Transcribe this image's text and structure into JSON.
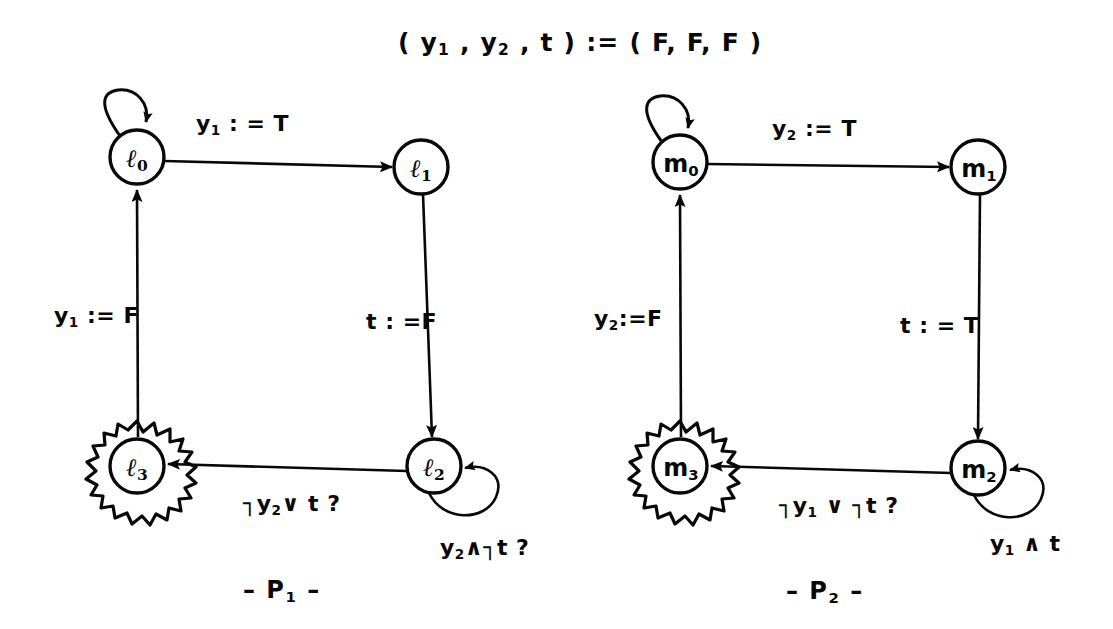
{
  "figure": {
    "title": "( y1 , y2 , t ) := ( F, F, F )",
    "title_parts": {
      "open": "( y",
      "sub1": "1",
      "comma1": " , y",
      "sub2": "2",
      "comma2": " , t ) := ( F, F, F )"
    },
    "background_color": "#ffffff",
    "ink_color": "#080808"
  },
  "processes": [
    {
      "id": "P1",
      "caption": "– P₁ –",
      "caption_base": "– P",
      "caption_sub": "1",
      "caption_tail": " –",
      "nodes": [
        {
          "name": "l0",
          "label_base": "ℓ",
          "label_sub": "0",
          "style": "plain",
          "has_self_loop": true
        },
        {
          "name": "l1",
          "label_base": "ℓ",
          "label_sub": "1",
          "style": "plain",
          "has_self_loop": false
        },
        {
          "name": "l2",
          "label_base": "ℓ",
          "label_sub": "2",
          "style": "plain",
          "has_self_loop": true
        },
        {
          "name": "l3",
          "label_base": "ℓ",
          "label_sub": "3",
          "style": "starburst",
          "has_self_loop": false
        }
      ],
      "edges": [
        {
          "from": "l0",
          "to": "l1",
          "label_base": "y",
          "label_sub": "1",
          "label_tail": " : = T"
        },
        {
          "from": "l1",
          "to": "l2",
          "label_base": "t",
          "label_sub": "",
          "label_tail": " : =F"
        },
        {
          "from": "l2",
          "to": "l3",
          "label_base": "┐y",
          "label_sub": "2",
          "label_tail": "∨ t ?"
        },
        {
          "from": "l3",
          "to": "l0",
          "label_base": "y",
          "label_sub": "1",
          "label_tail": " := F"
        },
        {
          "from": "l2",
          "to": "l2",
          "label_base": "y",
          "label_sub": "2",
          "label_tail": "∧┐t ?"
        },
        {
          "from": "l0",
          "to": "l0",
          "label_base": "",
          "label_sub": "",
          "label_tail": ""
        }
      ]
    },
    {
      "id": "P2",
      "caption": "– P₂ –",
      "caption_base": "– P",
      "caption_sub": "2",
      "caption_tail": " –",
      "nodes": [
        {
          "name": "m0",
          "label_base": "m",
          "label_sub": "0",
          "style": "plain",
          "has_self_loop": true
        },
        {
          "name": "m1",
          "label_base": "m",
          "label_sub": "1",
          "style": "plain",
          "has_self_loop": false
        },
        {
          "name": "m2",
          "label_base": "m",
          "label_sub": "2",
          "style": "plain",
          "has_self_loop": true
        },
        {
          "name": "m3",
          "label_base": "m",
          "label_sub": "3",
          "style": "starburst",
          "has_self_loop": false
        }
      ],
      "edges": [
        {
          "from": "m0",
          "to": "m1",
          "label_base": "y",
          "label_sub": "2",
          "label_tail": " := T"
        },
        {
          "from": "m1",
          "to": "m2",
          "label_base": "t",
          "label_sub": "",
          "label_tail": " : = T"
        },
        {
          "from": "m2",
          "to": "m3",
          "label_base": "┐y",
          "label_sub": "1",
          "label_tail": " ∨ ┐t ?"
        },
        {
          "from": "m3",
          "to": "m0",
          "label_base": "y",
          "label_sub": "2",
          "label_tail": ":=F"
        },
        {
          "from": "m2",
          "to": "m2",
          "label_base": "y",
          "label_sub": "1",
          "label_tail": " ∧ t"
        },
        {
          "from": "m0",
          "to": "m0",
          "label_base": "",
          "label_sub": "",
          "label_tail": ""
        }
      ]
    }
  ],
  "labels": {
    "p1_e01_base": "y",
    "p1_e01_sub": "1",
    "p1_e01_tail": " : = T",
    "p1_e12_base": "t",
    "p1_e12_tail": " : =F",
    "p1_e23_base": "┐y",
    "p1_e23_sub": "2",
    "p1_e23_tail": "∨ t ?",
    "p1_e30_base": "y",
    "p1_e30_sub": "1",
    "p1_e30_tail": " := F",
    "p1_loop2_base": "y",
    "p1_loop2_sub": "2",
    "p1_loop2_tail": "∧┐t ?",
    "p1_caption_base": "– P",
    "p1_caption_sub": "1",
    "p1_caption_tail": " –",
    "p2_e01_base": "y",
    "p2_e01_sub": "2",
    "p2_e01_tail": " := T",
    "p2_e12_base": "t",
    "p2_e12_tail": " : = T",
    "p2_e23_base": "┐y",
    "p2_e23_sub": "1",
    "p2_e23_tail": " ∨ ┐t ?",
    "p2_e30_base": "y",
    "p2_e30_sub": "2",
    "p2_e30_tail": ":=F",
    "p2_loop2_base": "y",
    "p2_loop2_sub": "1",
    "p2_loop2_tail": " ∧ t",
    "p2_caption_base": "– P",
    "p2_caption_sub": "2",
    "p2_caption_tail": " –",
    "n_l0_base": "ℓ",
    "n_l0_sub": "0",
    "n_l1_base": "ℓ",
    "n_l1_sub": "1",
    "n_l2_base": "ℓ",
    "n_l2_sub": "2",
    "n_l3_base": "ℓ",
    "n_l3_sub": "3",
    "n_m0_base": "m",
    "n_m0_sub": "0",
    "n_m1_base": "m",
    "n_m1_sub": "1",
    "n_m2_base": "m",
    "n_m2_sub": "2",
    "n_m3_base": "m",
    "n_m3_sub": "3"
  }
}
